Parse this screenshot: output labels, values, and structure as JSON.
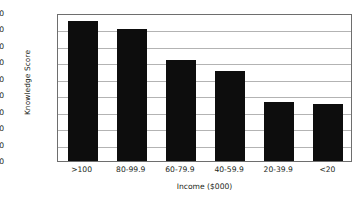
{
  "chart_data": {
    "type": "bar",
    "title": "",
    "xlabel": "Income ($000)",
    "ylabel": "Knowledge Score",
    "categories": [
      ">100",
      "80-99.9",
      "60-79.9",
      "40-59.9",
      "20-39.9",
      "<20"
    ],
    "values": [
      535,
      530,
      511.5,
      505,
      486,
      484.5
    ],
    "ylim": [
      450,
      540
    ],
    "yticks": [
      450,
      460,
      470,
      480,
      490,
      500,
      510,
      520,
      530,
      540
    ],
    "ytick_labels": [
      "450",
      "460",
      "470",
      "480",
      "490",
      "500",
      "510",
      "520",
      "530",
      "540"
    ],
    "grid": true,
    "legend": false,
    "bar_color": "#0d0d0d",
    "grid_color": "#b3b3b3",
    "frame_color": "#6e6e6e",
    "background_color": "#ffffff"
  }
}
